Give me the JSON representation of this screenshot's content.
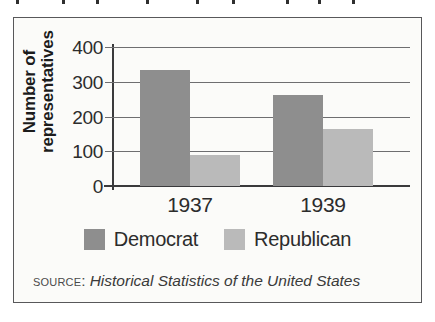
{
  "figure": {
    "background_color": "#fbfbf9",
    "border_color": "#58585a"
  },
  "chart_data": {
    "type": "bar",
    "title": "",
    "categories": [
      "1937",
      "1939"
    ],
    "series": [
      {
        "name": "Democrat",
        "values": [
          333,
          262
        ],
        "color": "#8e8e8e"
      },
      {
        "name": "Republican",
        "values": [
          88,
          165
        ],
        "color": "#bababa"
      }
    ],
    "xlabel": "",
    "ylabel": "Number of representatives",
    "ylim": [
      0,
      400
    ],
    "yticks": [
      0,
      100,
      200,
      300,
      400
    ],
    "ytick_labels": [
      "0",
      "100",
      "200",
      "300",
      "400"
    ],
    "grid": true,
    "grid_axis": "y",
    "legend_position": "bottom",
    "legend_entries": [
      "Democrat",
      "Republican"
    ]
  },
  "source": {
    "label": "Source:",
    "title": "Historical Statistics of the United States"
  }
}
